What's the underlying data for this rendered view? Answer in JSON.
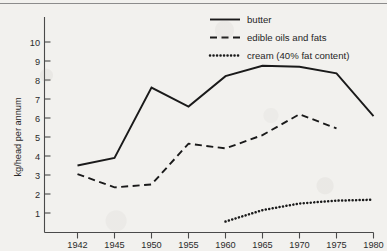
{
  "chart_data": {
    "type": "line",
    "title": "",
    "xlabel": "",
    "ylabel": "kg/head per annum",
    "categories": [
      "1942",
      "1945",
      "1950",
      "1955",
      "1960",
      "1965",
      "1970",
      "1975",
      "1980"
    ],
    "ytick_labels": [
      "1",
      "2",
      "3",
      "4",
      "5",
      "6",
      "7",
      "8",
      "9",
      "10"
    ],
    "ylim": [
      0,
      10.8
    ],
    "grid": false,
    "legend_position": "top-right",
    "series": [
      {
        "name": "butter",
        "style": "solid",
        "values": [
          3.5,
          3.9,
          7.6,
          6.6,
          8.2,
          8.75,
          8.7,
          8.35,
          6.1
        ]
      },
      {
        "name": "edible oils and fats",
        "style": "dashed",
        "values": [
          3.05,
          2.35,
          2.5,
          4.65,
          4.4,
          5.1,
          6.2,
          5.45,
          null
        ]
      },
      {
        "name": "cream (40% fat content)",
        "style": "dotted",
        "values": [
          null,
          null,
          null,
          null,
          0.55,
          1.15,
          1.5,
          1.65,
          1.7
        ]
      }
    ]
  },
  "axes": {
    "y_label": "kg/head per annum",
    "y_ticks": [
      "10",
      "9",
      "8",
      "7",
      "6",
      "5",
      "4",
      "3",
      "2",
      "1"
    ],
    "x_ticks": [
      "1942",
      "1945",
      "1950",
      "1955",
      "1960",
      "1965",
      "1970",
      "1975",
      "1980"
    ]
  },
  "legend": {
    "items": [
      {
        "label": "butter",
        "style": "solid"
      },
      {
        "label": "edible oils and fats",
        "style": "dashed"
      },
      {
        "label": "cream (40% fat content)",
        "style": "dotted"
      }
    ]
  },
  "colors": {
    "ink": "#1a1a1a",
    "axis": "#4a4a4a",
    "background": "#f2f1ee",
    "rule": "#8c8c8c"
  }
}
